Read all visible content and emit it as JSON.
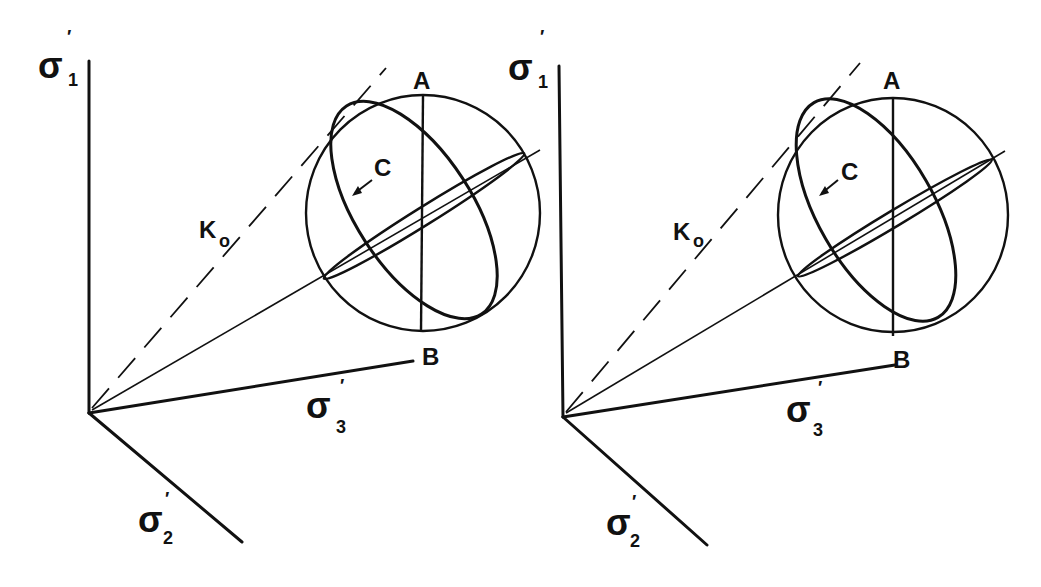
{
  "figure": {
    "type": "stereo-pair diagram of principal effective stress space",
    "panels": [
      {
        "id": "left",
        "axes": {
          "sigma1": {
            "symbol": "σ",
            "sub": "1",
            "prime": "′"
          },
          "sigma2": {
            "symbol": "σ",
            "sub": "2",
            "prime": "′"
          },
          "sigma3": {
            "symbol": "σ",
            "sub": "3",
            "prime": "′"
          }
        },
        "labels": {
          "ko": "K",
          "ko_sub": "o",
          "a": "A",
          "b": "B",
          "c": "C"
        }
      },
      {
        "id": "right",
        "axes": {
          "sigma1": {
            "symbol": "σ",
            "sub": "1",
            "prime": "′"
          },
          "sigma2": {
            "symbol": "σ",
            "sub": "2",
            "prime": "′"
          },
          "sigma3": {
            "symbol": "σ",
            "sub": "3",
            "prime": "′"
          }
        },
        "labels": {
          "ko": "K",
          "ko_sub": "o",
          "a": "A",
          "b": "B",
          "c": "C"
        }
      }
    ]
  }
}
